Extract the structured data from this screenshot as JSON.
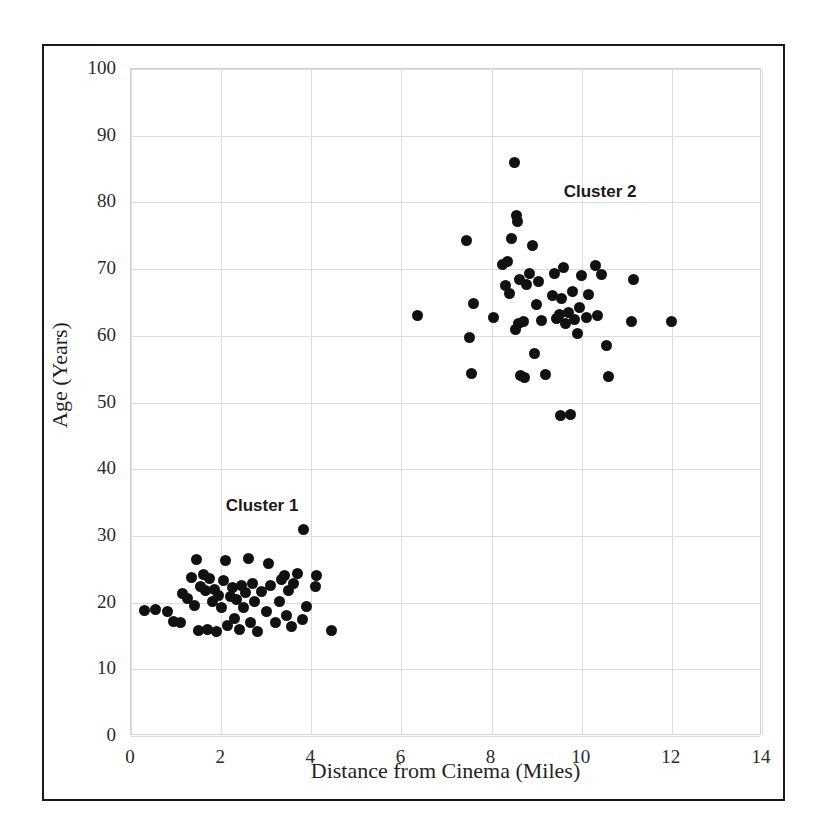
{
  "chart_data": {
    "type": "scatter",
    "title": "",
    "xlabel": "Distance from Cinema (Miles)",
    "ylabel": "Age (Years)",
    "xlim": [
      0,
      14
    ],
    "ylim": [
      0,
      100
    ],
    "xticks": [
      0,
      2,
      4,
      6,
      8,
      10,
      12,
      14
    ],
    "yticks": [
      0,
      10,
      20,
      30,
      40,
      50,
      60,
      70,
      80,
      90,
      100
    ],
    "grid": true,
    "legend": "none",
    "marker": {
      "shape": "circle",
      "color": "#111111",
      "size": 11
    },
    "annotations": [
      {
        "text": "Cluster 1",
        "x": 2.1,
        "y": 34.5
      },
      {
        "text": "Cluster 2",
        "x": 9.6,
        "y": 81.5
      }
    ],
    "series": [
      {
        "name": "Cluster 1",
        "points": [
          [
            0.3,
            18.8
          ],
          [
            0.55,
            18.9
          ],
          [
            0.8,
            18.6
          ],
          [
            0.95,
            17.2
          ],
          [
            1.1,
            17.0
          ],
          [
            1.15,
            21.4
          ],
          [
            1.25,
            20.6
          ],
          [
            1.35,
            23.8
          ],
          [
            1.4,
            19.5
          ],
          [
            1.45,
            26.4
          ],
          [
            1.5,
            15.8
          ],
          [
            1.55,
            22.4
          ],
          [
            1.6,
            24.2
          ],
          [
            1.65,
            21.8
          ],
          [
            1.7,
            16.0
          ],
          [
            1.75,
            23.6
          ],
          [
            1.8,
            20.2
          ],
          [
            1.85,
            22.0
          ],
          [
            1.9,
            15.6
          ],
          [
            1.95,
            21.0
          ],
          [
            2.0,
            19.3
          ],
          [
            2.05,
            23.3
          ],
          [
            2.1,
            26.3
          ],
          [
            2.15,
            16.5
          ],
          [
            2.2,
            20.9
          ],
          [
            2.25,
            22.2
          ],
          [
            2.3,
            17.6
          ],
          [
            2.35,
            20.4
          ],
          [
            2.4,
            16.0
          ],
          [
            2.45,
            22.5
          ],
          [
            2.5,
            19.2
          ],
          [
            2.55,
            21.5
          ],
          [
            2.6,
            26.6
          ],
          [
            2.65,
            17.0
          ],
          [
            2.7,
            22.9
          ],
          [
            2.75,
            20.1
          ],
          [
            2.8,
            15.7
          ],
          [
            2.9,
            21.6
          ],
          [
            3.0,
            18.6
          ],
          [
            3.05,
            25.8
          ],
          [
            3.1,
            22.6
          ],
          [
            3.2,
            17.0
          ],
          [
            3.3,
            20.1
          ],
          [
            3.35,
            23.5
          ],
          [
            3.4,
            24.0
          ],
          [
            3.45,
            18.0
          ],
          [
            3.5,
            21.8
          ],
          [
            3.55,
            16.4
          ],
          [
            3.6,
            22.9
          ],
          [
            3.7,
            24.3
          ],
          [
            3.8,
            17.5
          ],
          [
            3.82,
            31.0
          ],
          [
            3.9,
            19.4
          ],
          [
            4.1,
            22.4
          ],
          [
            4.12,
            24.1
          ],
          [
            4.45,
            15.8
          ]
        ]
      },
      {
        "name": "Cluster 2",
        "points": [
          [
            6.35,
            63.1
          ],
          [
            7.45,
            74.3
          ],
          [
            7.5,
            59.7
          ],
          [
            7.55,
            54.4
          ],
          [
            7.6,
            64.9
          ],
          [
            8.05,
            62.7
          ],
          [
            8.25,
            70.7
          ],
          [
            8.3,
            67.5
          ],
          [
            8.35,
            71.2
          ],
          [
            8.4,
            66.4
          ],
          [
            8.45,
            74.6
          ],
          [
            8.5,
            86.0
          ],
          [
            8.52,
            60.9
          ],
          [
            8.55,
            78.0
          ],
          [
            8.58,
            77.2
          ],
          [
            8.6,
            61.8
          ],
          [
            8.62,
            68.5
          ],
          [
            8.65,
            54.0
          ],
          [
            8.7,
            62.2
          ],
          [
            8.72,
            53.8
          ],
          [
            8.78,
            67.7
          ],
          [
            8.85,
            69.4
          ],
          [
            8.9,
            73.6
          ],
          [
            8.95,
            57.3
          ],
          [
            9.0,
            64.7
          ],
          [
            9.05,
            68.2
          ],
          [
            9.1,
            62.3
          ],
          [
            9.2,
            54.2
          ],
          [
            9.35,
            66.0
          ],
          [
            9.4,
            69.4
          ],
          [
            9.45,
            62.6
          ],
          [
            9.5,
            63.2
          ],
          [
            9.52,
            48.0
          ],
          [
            9.55,
            65.6
          ],
          [
            9.6,
            70.2
          ],
          [
            9.65,
            61.9
          ],
          [
            9.7,
            63.5
          ],
          [
            9.75,
            48.2
          ],
          [
            9.8,
            66.7
          ],
          [
            9.85,
            62.5
          ],
          [
            9.9,
            60.3
          ],
          [
            9.95,
            64.3
          ],
          [
            10.0,
            69.0
          ],
          [
            10.1,
            62.8
          ],
          [
            10.15,
            66.2
          ],
          [
            10.3,
            70.5
          ],
          [
            10.35,
            63.0
          ],
          [
            10.45,
            69.2
          ],
          [
            10.55,
            58.6
          ],
          [
            10.6,
            53.9
          ],
          [
            11.1,
            62.2
          ],
          [
            11.15,
            68.5
          ],
          [
            12.0,
            62.1
          ]
        ]
      }
    ]
  },
  "axes": {
    "y_tick_labels": [
      "100",
      "90",
      "80",
      "70",
      "60",
      "50",
      "40",
      "30",
      "20",
      "10",
      "0"
    ],
    "x_tick_labels": [
      "0",
      "2",
      "4",
      "6",
      "8",
      "10",
      "12",
      "14"
    ],
    "x_title": "Distance from Cinema (Miles)",
    "y_title": "Age (Years)"
  }
}
